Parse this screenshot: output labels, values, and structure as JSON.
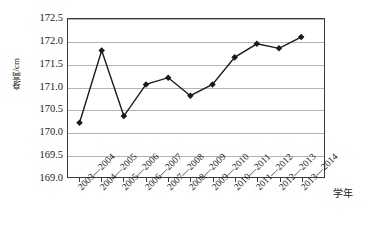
{
  "chart_data": {
    "type": "line",
    "title": "",
    "xlabel": "学年",
    "ylabel": "身高/cm",
    "categories": [
      "2003—2004",
      "2004—2005",
      "2005—2006",
      "2006—2007",
      "2007—2008",
      "2008—2009",
      "2009—2010",
      "2010—2011",
      "2011—2012",
      "2012—2013",
      "2013—2014"
    ],
    "values": [
      170.2,
      171.8,
      170.35,
      171.05,
      171.2,
      170.8,
      171.05,
      171.65,
      171.95,
      171.85,
      172.1
    ],
    "ylim": [
      169.0,
      172.5
    ],
    "yticks": [
      "169.0",
      "169.5",
      "170.0",
      "170.5",
      "171.0",
      "171.5",
      "172.0",
      "172.5"
    ],
    "ytick_values": [
      169.0,
      169.5,
      170.0,
      170.5,
      171.0,
      171.5,
      172.0,
      172.5
    ],
    "grid": true,
    "legend": "none",
    "marker": "diamond",
    "line_color": "#1a1a1a",
    "marker_color": "#1a1a1a",
    "grid_color": "#b3b3b3",
    "frame_color": "#3a3a3a"
  }
}
